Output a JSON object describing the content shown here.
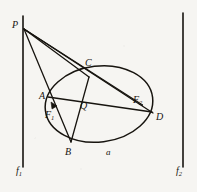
{
  "figure": {
    "background_color": "#f6f5f2",
    "ink_color": "#17140f",
    "labels": {
      "P": "P",
      "A": "A",
      "B": "B",
      "C": "C",
      "D": "D",
      "Q": "Q",
      "F1_base": "F",
      "F1_sub": "1",
      "F2_base": "F",
      "F2_sub": "2",
      "a": "a",
      "f1_base": "f",
      "f1_sub": "1",
      "f2_base": "f",
      "f2_sub": "2"
    },
    "points": {
      "P": {
        "x": 24,
        "y": 29
      },
      "A": {
        "x": 48,
        "y": 97
      },
      "B": {
        "x": 71,
        "y": 142
      },
      "C": {
        "x": 89,
        "y": 77
      },
      "D": {
        "x": 153,
        "y": 113
      },
      "Q": {
        "x": 87,
        "y": 102
      },
      "F1": {
        "x": 54,
        "y": 106
      },
      "F2": {
        "x": 141,
        "y": 104
      }
    },
    "ellipse": {
      "cx": 99,
      "cy": 104,
      "rx": 54,
      "ry": 38,
      "rotation_deg": -7
    },
    "directrices": {
      "f1": {
        "x": 23,
        "y_top": 16,
        "y_bottom": 167
      },
      "f2": {
        "x": 183,
        "y_top": 13,
        "y_bottom": 167
      }
    },
    "segments": [
      {
        "name": "P-B",
        "from": "P",
        "to": "B"
      },
      {
        "name": "P-A-D",
        "from": "P",
        "to": "D"
      },
      {
        "name": "P-C",
        "from": "P",
        "to": "C"
      },
      {
        "name": "P-F2",
        "from": "P",
        "to": "F2"
      },
      {
        "name": "A-F2",
        "from": "A",
        "to": "F2"
      },
      {
        "name": "C-B",
        "from": "C",
        "to": "B"
      }
    ]
  }
}
